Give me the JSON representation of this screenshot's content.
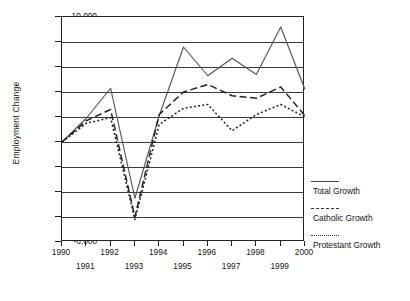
{
  "chart_data": {
    "type": "line",
    "title": "",
    "xlabel": "",
    "ylabel": "Employment Change",
    "x": [
      1990,
      1991,
      1992,
      1993,
      1994,
      1995,
      1996,
      1997,
      1998,
      1999,
      2000
    ],
    "xlim": [
      1990,
      2000
    ],
    "ylim": [
      -8000,
      10000
    ],
    "grid": true,
    "legend_position": "right",
    "xticklabels": [
      "1990",
      "1991",
      "1992",
      "1993",
      "1994",
      "1995",
      "1996",
      "1997",
      "1998",
      "1999",
      "2000"
    ],
    "yticklabels": [
      "10,000",
      "8,000",
      "6,000",
      "4,000",
      "2,000",
      "0",
      "-2,000",
      "-4,000",
      "-6,000",
      "-8,000"
    ],
    "yticks": [
      10000,
      8000,
      6000,
      4000,
      2000,
      0,
      -2000,
      -4000,
      -6000,
      -8000
    ],
    "series": [
      {
        "name": "Total Growth",
        "style": "solid",
        "color": "#555555",
        "values": [
          0,
          1900,
          4300,
          -4500,
          2100,
          7600,
          5300,
          6700,
          5400,
          9200,
          4200
        ]
      },
      {
        "name": "Catholic Growth",
        "style": "dashed",
        "color": "#222222",
        "values": [
          0,
          1700,
          2600,
          -6000,
          2200,
          4000,
          4600,
          3700,
          3500,
          4400,
          2100
        ]
      },
      {
        "name": "Protestant Growth",
        "style": "dotted",
        "color": "#222222",
        "values": [
          0,
          1500,
          1950,
          -6200,
          1400,
          2700,
          3000,
          900,
          2200,
          3000,
          2000
        ]
      }
    ]
  },
  "legend": {
    "items": [
      {
        "label": "Total Growth"
      },
      {
        "label": "Catholic Growth"
      },
      {
        "label": "Protestant Growth"
      }
    ]
  }
}
